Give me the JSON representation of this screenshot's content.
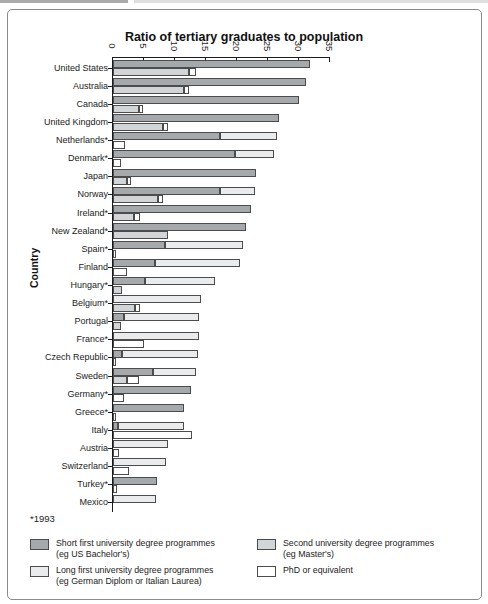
{
  "chart_data": {
    "type": "bar",
    "orientation": "horizontal",
    "title": "Ratio of tertiary graduates to population",
    "ylabel": "Country",
    "footnote": "*1993",
    "axis": {
      "min": 0,
      "max": 35,
      "ticks": [
        0,
        5,
        10,
        15,
        20,
        25,
        30,
        35
      ],
      "tick_labels": [
        "0",
        "5",
        "10",
        "15",
        "20",
        "25",
        "30",
        "35"
      ]
    },
    "legend": [
      {
        "key": "short_first",
        "label": "Short first university degree programmes",
        "sublabel": "(eg US Bachelor's)",
        "color": "#a5a9ac"
      },
      {
        "key": "second",
        "label": "Second university degree programmes",
        "sublabel": "(eg Master's)",
        "color": "#d2d5d8"
      },
      {
        "key": "long_first",
        "label": "Long first university degree programmes",
        "sublabel": "(eg German Diplom or Italian Laurea)",
        "color": "#e9ebec"
      },
      {
        "key": "phd",
        "label": "PhD or equivalent",
        "sublabel": "",
        "color": "#ffffff"
      }
    ],
    "row_structure": {
      "row1": [
        "short_first",
        "long_first"
      ],
      "row2": [
        "second",
        "phd"
      ]
    },
    "countries": [
      {
        "name": "United States",
        "short_first": 31.8,
        "long_first": 0,
        "second": 12.3,
        "phd": 1.1
      },
      {
        "name": "Australia",
        "short_first": 31.2,
        "long_first": 0,
        "second": 11.5,
        "phd": 0.9
      },
      {
        "name": "Canada",
        "short_first": 30.0,
        "long_first": 0,
        "second": 4.2,
        "phd": 0.8
      },
      {
        "name": "United Kingdom",
        "short_first": 26.9,
        "long_first": 0,
        "second": 8.1,
        "phd": 0.8
      },
      {
        "name": "Netherlands*",
        "short_first": 17.4,
        "long_first": 9.1,
        "second": 0,
        "phd": 2.0
      },
      {
        "name": "Denmark*",
        "short_first": 19.8,
        "long_first": 6.2,
        "second": 0,
        "phd": 1.3
      },
      {
        "name": "Japan",
        "short_first": 23.2,
        "long_first": 0,
        "second": 2.4,
        "phd": 0.6
      },
      {
        "name": "Norway",
        "short_first": 17.4,
        "long_first": 5.6,
        "second": 7.3,
        "phd": 0.9
      },
      {
        "name": "Ireland*",
        "short_first": 22.3,
        "long_first": 0,
        "second": 3.4,
        "phd": 1.1
      },
      {
        "name": "New Zealand*",
        "short_first": 21.5,
        "long_first": 0,
        "second": 9.0,
        "phd": 0
      },
      {
        "name": "Spain*",
        "short_first": 8.4,
        "long_first": 12.7,
        "second": 0,
        "phd": 0.6
      },
      {
        "name": "Finland",
        "short_first": 6.9,
        "long_first": 13.7,
        "second": 0,
        "phd": 2.3
      },
      {
        "name": "Hungary*",
        "short_first": 5.2,
        "long_first": 11.3,
        "second": 1.6,
        "phd": 0
      },
      {
        "name": "Belgium*",
        "short_first": 0,
        "long_first": 14.2,
        "second": 3.7,
        "phd": 0.8
      },
      {
        "name": "Portugal",
        "short_first": 1.8,
        "long_first": 12.2,
        "second": 1.3,
        "phd": 0
      },
      {
        "name": "France*",
        "short_first": 0,
        "long_first": 13.9,
        "second": 0,
        "phd": 5.0
      },
      {
        "name": "Czech Republic",
        "short_first": 1.6,
        "long_first": 12.2,
        "second": 0,
        "phd": 0.4
      },
      {
        "name": "Sweden",
        "short_first": 6.6,
        "long_first": 6.8,
        "second": 2.4,
        "phd": 1.8
      },
      {
        "name": "Germany*",
        "short_first": 12.6,
        "long_first": 0,
        "second": 0,
        "phd": 1.9
      },
      {
        "name": "Greece*",
        "short_first": 11.6,
        "long_first": 0,
        "second": 0,
        "phd": 0.4
      },
      {
        "name": "Italy",
        "short_first": 0.9,
        "long_first": 10.6,
        "second": 0,
        "phd": 12.9
      },
      {
        "name": "Austria",
        "short_first": 0,
        "long_first": 9.0,
        "second": 0,
        "phd": 1.0
      },
      {
        "name": "Switzerland",
        "short_first": 0,
        "long_first": 8.7,
        "second": 0,
        "phd": 2.6
      },
      {
        "name": "Turkey*",
        "short_first": 7.1,
        "long_first": 0,
        "second": 0,
        "phd": 0.8
      },
      {
        "name": "Mexico",
        "short_first": 0,
        "long_first": 7.0,
        "second": 0,
        "phd": 0
      }
    ]
  }
}
